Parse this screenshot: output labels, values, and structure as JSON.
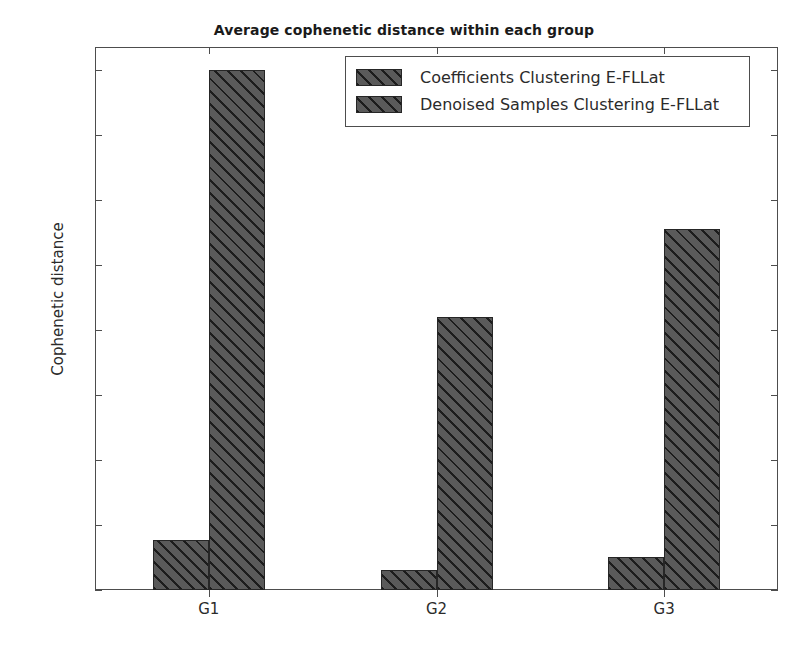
{
  "chart_data": {
    "type": "bar",
    "title": "Average cophenetic distance within each group",
    "xlabel": "",
    "ylabel": "Cophenetic distance",
    "categories": [
      "G1",
      "G2",
      "G3"
    ],
    "series": [
      {
        "name": "Coefficients Clustering E-FLLat",
        "values": [
          0.77,
          0.31,
          0.5
        ]
      },
      {
        "name": "Denoised Samples Clustering E-FLLat",
        "values": [
          8.0,
          4.2,
          5.55
        ]
      }
    ],
    "ylim": [
      0,
      8.35
    ],
    "yticks": [
      0,
      1,
      2,
      3,
      4,
      5,
      6,
      7,
      8
    ],
    "ytick_labels": [
      "0",
      "1",
      "2",
      "3",
      "4",
      "5",
      "6",
      "7",
      "8"
    ],
    "grid": false,
    "legend_position": "upper center",
    "bar_facecolor": "#5a5a5a",
    "bar_edgecolor": "#262626",
    "bar_hatch": "/",
    "axes_color": "#4d4d4d",
    "background": "#ffffff"
  }
}
